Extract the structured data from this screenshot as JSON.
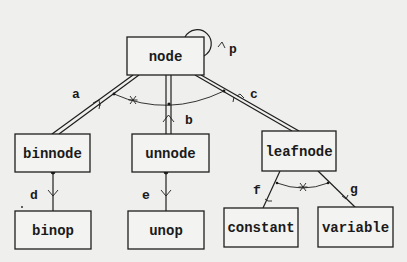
{
  "diagram": {
    "type": "entity-relationship / class hierarchy",
    "entities": [
      {
        "id": "node",
        "label": "node"
      },
      {
        "id": "binnode",
        "label": "binnode"
      },
      {
        "id": "unnode",
        "label": "unnode"
      },
      {
        "id": "leafnode",
        "label": "leafnode"
      },
      {
        "id": "binop",
        "label": "binop"
      },
      {
        "id": "unop",
        "label": "unop"
      },
      {
        "id": "constant",
        "label": "constant"
      },
      {
        "id": "variable",
        "label": "variable"
      }
    ],
    "relationships": [
      {
        "label": "p",
        "from": "node",
        "to": "node",
        "kind": "self-loop"
      },
      {
        "label": "a",
        "from": "node",
        "to": "binnode",
        "kind": "double-line subtype"
      },
      {
        "label": "b",
        "from": "node",
        "to": "unnode",
        "kind": "double-line subtype"
      },
      {
        "label": "c",
        "from": "node",
        "to": "leafnode",
        "kind": "double-line subtype"
      },
      {
        "label": "d",
        "from": "binnode",
        "to": "binop",
        "kind": "arrow"
      },
      {
        "label": "e",
        "from": "unnode",
        "to": "unop",
        "kind": "arrow"
      },
      {
        "label": "f",
        "from": "leafnode",
        "to": "constant",
        "kind": "arrow"
      },
      {
        "label": "g",
        "from": "leafnode",
        "to": "variable",
        "kind": "arrow"
      }
    ],
    "constraints": [
      {
        "symbol": "*",
        "spans": [
          "a",
          "b",
          "c"
        ]
      },
      {
        "symbol": "*",
        "spans": [
          "f",
          "g"
        ]
      }
    ]
  }
}
